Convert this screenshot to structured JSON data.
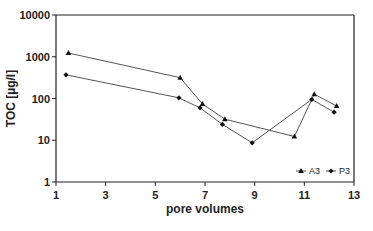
{
  "chart_data": {
    "type": "line",
    "title": "",
    "xlabel": "pore volumes",
    "ylabel": "TOC [µg/l]",
    "xlim": [
      1,
      13
    ],
    "ylim": [
      1,
      10000
    ],
    "yscale": "log",
    "x_ticks": [
      1,
      3,
      5,
      7,
      9,
      11,
      13
    ],
    "y_ticks": [
      1,
      10,
      100,
      1000,
      10000
    ],
    "grid": false,
    "legend_position": "lower right, inside",
    "series": [
      {
        "name": "A3",
        "marker": "triangle",
        "color": "#555555",
        "points": [
          {
            "x": 1.5,
            "y": 1230
          },
          {
            "x": 6.0,
            "y": 315
          },
          {
            "x": 6.9,
            "y": 74
          },
          {
            "x": 7.8,
            "y": 32
          },
          {
            "x": 10.6,
            "y": 12.3
          },
          {
            "x": 11.4,
            "y": 127
          },
          {
            "x": 12.3,
            "y": 66
          }
        ]
      },
      {
        "name": "P3",
        "marker": "diamond",
        "color": "#555555",
        "points": [
          {
            "x": 1.4,
            "y": 370
          },
          {
            "x": 5.95,
            "y": 104
          },
          {
            "x": 6.8,
            "y": 60
          },
          {
            "x": 7.7,
            "y": 24
          },
          {
            "x": 8.9,
            "y": 8.7
          },
          {
            "x": 11.3,
            "y": 95
          },
          {
            "x": 12.2,
            "y": 47
          }
        ]
      }
    ]
  },
  "labels": {
    "x_ticks": [
      "1",
      "3",
      "5",
      "7",
      "9",
      "11",
      "13"
    ],
    "y_ticks": [
      "1",
      "10",
      "100",
      "1000",
      "10000"
    ],
    "xlabel": "pore volumes",
    "ylabel": "TOC [µg/l]",
    "legend": [
      "A3",
      "P3"
    ]
  }
}
